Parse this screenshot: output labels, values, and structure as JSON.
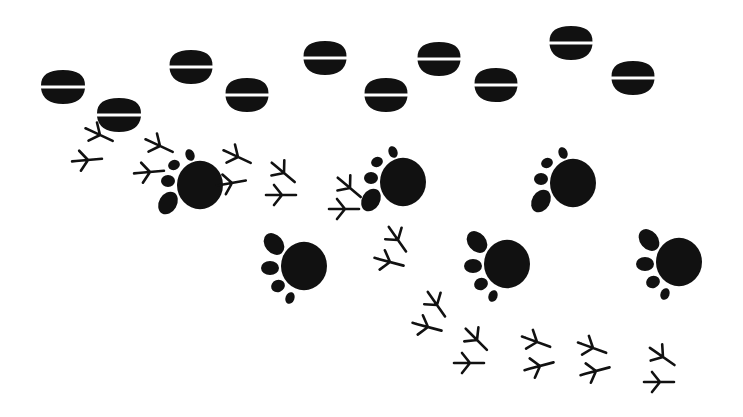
{
  "illustration": {
    "subject": "animal tracks",
    "ink_color": "#111111",
    "background_color": "#ffffff",
    "hoof_prints": [
      {
        "x": 63,
        "y": 87,
        "w": 44,
        "rot": 0
      },
      {
        "x": 119,
        "y": 115,
        "w": 44,
        "rot": 0
      },
      {
        "x": 191,
        "y": 67,
        "w": 43,
        "rot": 0
      },
      {
        "x": 247,
        "y": 95,
        "w": 43,
        "rot": 0
      },
      {
        "x": 325,
        "y": 58,
        "w": 43,
        "rot": 0
      },
      {
        "x": 439,
        "y": 59,
        "w": 43,
        "rot": 0
      },
      {
        "x": 386,
        "y": 95,
        "w": 43,
        "rot": 0
      },
      {
        "x": 496,
        "y": 85,
        "w": 43,
        "rot": 0
      },
      {
        "x": 571,
        "y": 43,
        "w": 43,
        "rot": 0
      },
      {
        "x": 633,
        "y": 78,
        "w": 43,
        "rot": 0
      }
    ],
    "paw_prints": [
      {
        "x": 200,
        "y": 185,
        "r": 23,
        "variant": "a"
      },
      {
        "x": 403,
        "y": 182,
        "r": 23,
        "variant": "a"
      },
      {
        "x": 573,
        "y": 183,
        "r": 23,
        "variant": "a"
      },
      {
        "x": 304,
        "y": 266,
        "r": 23,
        "variant": "b"
      },
      {
        "x": 507,
        "y": 264,
        "r": 23,
        "variant": "b"
      },
      {
        "x": 679,
        "y": 262,
        "r": 23,
        "variant": "b"
      }
    ],
    "bird_tracks": [
      {
        "x": 100,
        "y": 135,
        "rot": 25
      },
      {
        "x": 88,
        "y": 160,
        "rot": -5
      },
      {
        "x": 160,
        "y": 146,
        "rot": 25
      },
      {
        "x": 150,
        "y": 172,
        "rot": -5
      },
      {
        "x": 238,
        "y": 157,
        "rot": 25
      },
      {
        "x": 232,
        "y": 183,
        "rot": -10
      },
      {
        "x": 284,
        "y": 173,
        "rot": 40
      },
      {
        "x": 282,
        "y": 195,
        "rot": 0
      },
      {
        "x": 350,
        "y": 188,
        "rot": 40
      },
      {
        "x": 345,
        "y": 209,
        "rot": 0
      },
      {
        "x": 398,
        "y": 240,
        "rot": 55
      },
      {
        "x": 390,
        "y": 262,
        "rot": 15
      },
      {
        "x": 437,
        "y": 305,
        "rot": 55
      },
      {
        "x": 428,
        "y": 327,
        "rot": 15
      },
      {
        "x": 477,
        "y": 340,
        "rot": 45
      },
      {
        "x": 470,
        "y": 363,
        "rot": 0
      },
      {
        "x": 537,
        "y": 342,
        "rot": 20
      },
      {
        "x": 540,
        "y": 366,
        "rot": -15
      },
      {
        "x": 593,
        "y": 348,
        "rot": 20
      },
      {
        "x": 596,
        "y": 371,
        "rot": -15
      },
      {
        "x": 663,
        "y": 357,
        "rot": 35
      },
      {
        "x": 660,
        "y": 382,
        "rot": 0
      }
    ]
  }
}
